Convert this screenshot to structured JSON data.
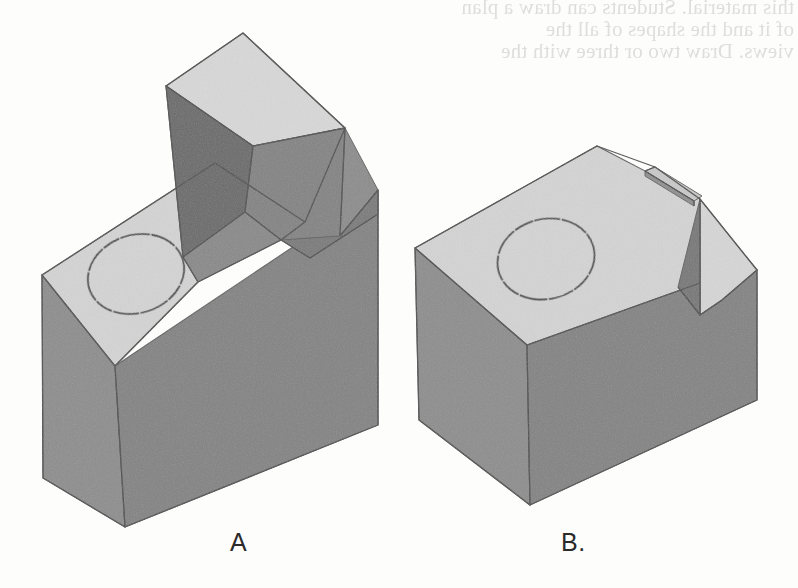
{
  "page": {
    "background_color": "#fdfdfc",
    "width": 798,
    "height": 588
  },
  "bleed_through": {
    "description": "faint mirrored show-through text from the reverse side of the scanned page",
    "line1": "this material. Students can draw a plan",
    "line2": "of it and the shapes of all the",
    "line3": "views. Draw two or three with the"
  },
  "figures": [
    {
      "id": "A",
      "label": "A",
      "label_x": 240,
      "label_y": 548,
      "description": "Pictorial (isometric) view of a rectangular block with a chamfered angled top face containing one circular through hole, and a tall raised rectangular rib rising from the rear of the chamfer.",
      "features": [
        "rectangular-block",
        "angled-chamfer-top-face",
        "circular-through-hole",
        "raised-rectangular-rib"
      ],
      "hole": {
        "cx": 136,
        "cy": 274,
        "rx": 49,
        "ry": 39,
        "rotation": -18
      }
    },
    {
      "id": "B",
      "label": "B.",
      "label_x": 575,
      "label_y": 548,
      "description": "Pictorial (isometric) view of the same rectangular block with a chamfered angled top face and circular through hole, but with a narrow vertical notch / V-shaped groove cut into the right end instead of the raised rib.",
      "features": [
        "rectangular-block",
        "angled-chamfer-top-face",
        "circular-through-hole",
        "narrow-vertical-notch",
        "v-groove-cut"
      ],
      "hole": {
        "cx": 546,
        "cy": 259,
        "rx": 49,
        "ry": 40,
        "rotation": -14
      }
    }
  ],
  "colors": {
    "top_face": "#d3d3d3",
    "top_face_light": "#d9d9d9",
    "front_face": "#8a8a8a",
    "side_face": "#7e7e7e",
    "dark_face": "#6b6b6b",
    "darkest_face": "#636363",
    "outline": "#5a5a5a",
    "hole_outline": "#4a4a4a",
    "label_text": "#2a2a2a",
    "background": "#fdfdfc"
  }
}
